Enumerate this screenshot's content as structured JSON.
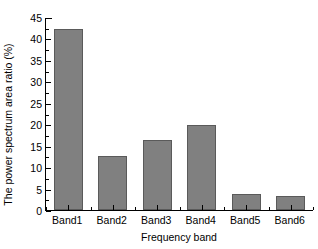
{
  "chart_data": {
    "type": "bar",
    "title": "",
    "xlabel": "Frequency band",
    "ylabel": "The power spectrum area ratio (%)",
    "categories": [
      "Band1",
      "Band2",
      "Band3",
      "Band4",
      "Band5",
      "Band6"
    ],
    "values": [
      42.2,
      12.7,
      16.3,
      19.9,
      3.8,
      3.3
    ],
    "ylim": [
      0,
      45
    ],
    "ytick_labels": [
      "0",
      "5",
      "10",
      "15",
      "20",
      "25",
      "30",
      "35",
      "40",
      "45"
    ],
    "ytick_values": [
      0,
      5,
      10,
      15,
      20,
      25,
      30,
      35,
      40,
      45
    ],
    "y_minor_step": 2.5,
    "grid": false,
    "legend": null,
    "bar_color": "#808080",
    "bar_edge_color": "#5a5a5a",
    "axis_color": "#000000",
    "background_color": "#ffffff"
  }
}
